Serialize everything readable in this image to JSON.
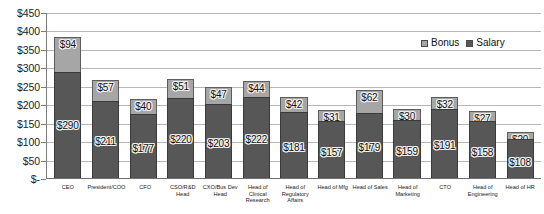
{
  "chart_data": {
    "type": "bar",
    "subtype": "stacked-bar",
    "title": "",
    "subtitle": "",
    "xlabel": "",
    "ylabel": "",
    "ylim": [
      0,
      450
    ],
    "y_tick_step": 50,
    "y_tick_labels": [
      "$450",
      "$400",
      "$350",
      "$300",
      "$250",
      "$200",
      "$150",
      "$100",
      "$50",
      "$-"
    ],
    "y_tick_values": [
      450,
      400,
      350,
      300,
      250,
      200,
      150,
      100,
      50,
      0
    ],
    "grid": "horizontal",
    "legend_position": "top-right",
    "categories": [
      "CEO",
      "President/COO",
      "CFO",
      "CSO/R&D Head",
      "CXO/Bus Dev Head",
      "Head of Clinical Research",
      "Head of Regulatory Affairs",
      "Head of Mfg",
      "Head of Sales",
      "Head of Marketing",
      "CTO",
      "Head of Engineering",
      "Head of HR"
    ],
    "series": [
      {
        "name": "Salary",
        "color": "#575757",
        "values": [
          290,
          211,
          177,
          220,
          203,
          222,
          181,
          157,
          179,
          159,
          191,
          158,
          108
        ],
        "labels": [
          "$290",
          "$211",
          "$177",
          "$220",
          "$203",
          "$222",
          "$181",
          "$157",
          "$179",
          "$159",
          "$191",
          "$158",
          "$108"
        ]
      },
      {
        "name": "Bonus",
        "color": "#a6a6a6",
        "values": [
          94,
          57,
          40,
          51,
          47,
          44,
          42,
          31,
          62,
          30,
          32,
          27,
          20
        ],
        "labels": [
          "$94",
          "$57",
          "$40",
          "$51",
          "$47",
          "$44",
          "$42",
          "$31",
          "$62",
          "$30",
          "$32",
          "$27",
          "$20"
        ]
      }
    ],
    "totals": [
      384,
      268,
      217,
      271,
      250,
      266,
      223,
      188,
      241,
      189,
      223,
      185,
      128
    ]
  },
  "legend": {
    "items": [
      {
        "label": "Bonus",
        "color": "#a6a6a6"
      },
      {
        "label": "Salary",
        "color": "#575757"
      }
    ]
  },
  "colors": {
    "salary": "#575757",
    "bonus": "#a6a6a6",
    "gridline": "#b6b6b6",
    "axis": "#7b7b7b",
    "background": "#ffffff",
    "text": "#111111"
  }
}
